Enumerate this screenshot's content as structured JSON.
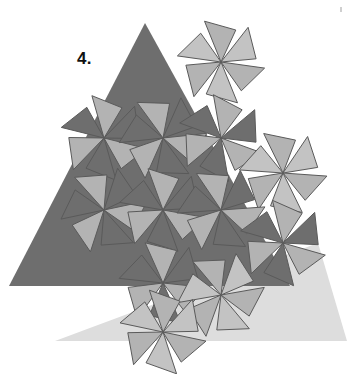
{
  "figure": {
    "label": "4.",
    "type": "geometric-tessellation",
    "background_color": "#ffffff",
    "canvas": {
      "width": 347,
      "height": 374
    }
  },
  "colors": {
    "dark_gray": "#6e6e6e",
    "mid_gray": "#7c7c7c",
    "light_gray": "#b3b3b3",
    "pale_gray": "#c3c3c3",
    "shadow_gray": "#dddddd",
    "stroke": "#5a5a5a",
    "label_color": "#111111",
    "background": "#ffffff"
  },
  "shapes": {
    "shadow_triangle": {
      "name": "shadow-triangle",
      "fill": "#dddddd",
      "points": "55,341 318,243 347,341"
    },
    "main_triangle": {
      "name": "main-triangle",
      "fill": "#6e6e6e",
      "points": "145,23 9,286 290,286"
    }
  },
  "pinwheels": [
    {
      "id": 1,
      "cx": 221,
      "cy": 62,
      "rot": 8,
      "radius": 44,
      "style": "light"
    },
    {
      "id": 2,
      "cx": 104,
      "cy": 138,
      "rot": 14,
      "radius": 44,
      "style": "mixed"
    },
    {
      "id": 3,
      "cx": 163,
      "cy": 138,
      "rot": -6,
      "radius": 44,
      "style": "mixed"
    },
    {
      "id": 4,
      "cx": 221,
      "cy": 138,
      "rot": 20,
      "radius": 44,
      "style": "mixed"
    },
    {
      "id": 5,
      "cx": 283,
      "cy": 173,
      "rot": 4,
      "radius": 44,
      "style": "light"
    },
    {
      "id": 6,
      "cx": 104,
      "cy": 210,
      "rot": -12,
      "radius": 44,
      "style": "mixed"
    },
    {
      "id": 7,
      "cx": 163,
      "cy": 210,
      "rot": 10,
      "radius": 44,
      "style": "mixed"
    },
    {
      "id": 8,
      "cx": 221,
      "cy": 210,
      "rot": -4,
      "radius": 44,
      "style": "mixed"
    },
    {
      "id": 9,
      "cx": 283,
      "cy": 243,
      "rot": 16,
      "radius": 44,
      "style": "mixed"
    },
    {
      "id": 10,
      "cx": 163,
      "cy": 283,
      "rot": 6,
      "radius": 44,
      "style": "mixed"
    },
    {
      "id": 11,
      "cx": 221,
      "cy": 295,
      "rot": -10,
      "radius": 44,
      "style": "light"
    },
    {
      "id": 12,
      "cx": 163,
      "cy": 332,
      "rot": 12,
      "radius": 44,
      "style": "light"
    }
  ],
  "blade_count": 6,
  "legend": {
    "note": "Each pinwheel unit consists of 6 triangular blades rotating about a shared vertex"
  }
}
